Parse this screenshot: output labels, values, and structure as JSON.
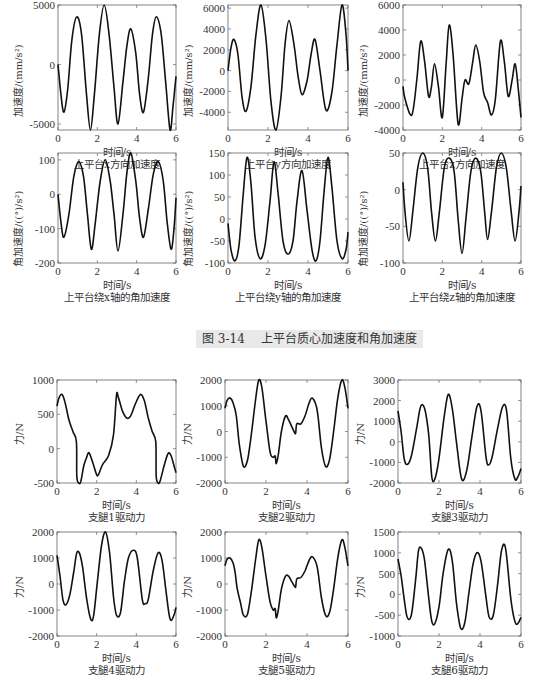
{
  "figure_caption": {
    "number": "图 3-14",
    "title": "上平台质心加速度和角加速度"
  },
  "chart_data": [
    {
      "id": "c1",
      "type": "line",
      "title": "上平台x方向加速度",
      "xlabel": "时间/s",
      "ylabel": "加速度/(mm/s²)",
      "box": [
        58,
        5,
        176,
        130
      ],
      "xlim": [
        0,
        6
      ],
      "ylim": [
        -5500,
        5000
      ],
      "xticks": [
        0,
        2,
        4,
        6
      ],
      "yticks": [
        -5000,
        0,
        5000
      ],
      "x": [
        0,
        0.15,
        0.3,
        0.5,
        0.7,
        0.95,
        1.2,
        1.45,
        1.65,
        1.85,
        2.1,
        2.35,
        2.6,
        2.85,
        3.05,
        3.3,
        3.5,
        3.7,
        3.95,
        4.15,
        4.35,
        4.6,
        4.8,
        5.0,
        5.25,
        5.5,
        5.7,
        5.85,
        6.0
      ],
      "y": [
        0,
        -2500,
        -4000,
        -2000,
        2000,
        4000,
        2500,
        -2500,
        -5500,
        -2500,
        2500,
        5000,
        2500,
        -2000,
        -5000,
        -1500,
        1500,
        3000,
        1000,
        -2500,
        -4000,
        -1000,
        2500,
        4000,
        2500,
        -2000,
        -5500,
        -3500,
        -1000
      ]
    },
    {
      "id": "c2",
      "type": "line",
      "title": "上平台y方向加速度",
      "xlabel": "时间/s",
      "ylabel": "加速度/(mm/s²)",
      "box": [
        228,
        5,
        348,
        130
      ],
      "xlim": [
        0,
        6
      ],
      "ylim": [
        -5700,
        6300
      ],
      "xticks": [
        0,
        2,
        4,
        6
      ],
      "yticks": [
        -4000,
        -2000,
        0,
        2000,
        4000,
        6000
      ],
      "x": [
        0,
        0.15,
        0.3,
        0.5,
        0.7,
        0.9,
        1.15,
        1.4,
        1.65,
        1.9,
        2.15,
        2.4,
        2.65,
        2.85,
        3.05,
        3.3,
        3.5,
        3.7,
        3.95,
        4.15,
        4.35,
        4.6,
        4.9,
        5.2,
        5.45,
        5.7,
        5.9,
        6.0
      ],
      "y": [
        0,
        2200,
        3000,
        1500,
        -2500,
        -3900,
        -1500,
        3500,
        6300,
        3000,
        -3000,
        -5700,
        -2500,
        2500,
        4800,
        2500,
        -500,
        -2300,
        -1000,
        1500,
        3000,
        0,
        -3800,
        -2000,
        2500,
        6300,
        3500,
        0
      ]
    },
    {
      "id": "c3",
      "type": "line",
      "title": "上平台z方向加速度",
      "xlabel": "时间/s",
      "ylabel": "加速度/(mm/s²)",
      "box": [
        403,
        5,
        521,
        130
      ],
      "xlim": [
        0,
        6
      ],
      "ylim": [
        -4000,
        6000
      ],
      "xticks": [
        0,
        2,
        4,
        6
      ],
      "yticks": [
        -4000,
        -2000,
        0,
        2000,
        4000,
        6000
      ],
      "x": [
        0,
        0.1,
        0.45,
        0.7,
        0.9,
        1.1,
        1.3,
        1.45,
        1.6,
        1.8,
        2.0,
        2.2,
        2.35,
        2.55,
        2.8,
        3.0,
        3.15,
        3.35,
        3.55,
        3.7,
        3.9,
        4.1,
        4.3,
        4.5,
        4.7,
        4.95,
        5.15,
        5.35,
        5.55,
        5.7,
        5.85,
        6.0
      ],
      "y": [
        -500,
        -1500,
        -2800,
        0,
        3100,
        1500,
        -1300,
        -500,
        1300,
        -500,
        -3000,
        1500,
        4400,
        2000,
        -3500,
        -1500,
        0,
        -300,
        1500,
        2800,
        1500,
        -1000,
        -1800,
        -2800,
        -1500,
        3100,
        1500,
        -1300,
        0,
        1300,
        -500,
        -3000
      ]
    },
    {
      "id": "c4",
      "type": "line",
      "title": "上平台绕x轴的角加速度",
      "xlabel": "时间/s",
      "ylabel": "角加速度/((°)/s²)",
      "box": [
        58,
        153,
        176,
        263
      ],
      "xlim": [
        0,
        6
      ],
      "ylim": [
        -200,
        120
      ],
      "xticks": [
        0,
        2,
        4,
        6
      ],
      "yticks": [
        -200,
        -100,
        0,
        100
      ],
      "x": [
        0,
        0.15,
        0.3,
        0.55,
        0.8,
        1.05,
        1.3,
        1.5,
        1.7,
        1.9,
        2.15,
        2.4,
        2.65,
        2.85,
        3.05,
        3.3,
        3.5,
        3.7,
        3.95,
        4.15,
        4.35,
        4.6,
        4.85,
        5.1,
        5.35,
        5.55,
        5.75,
        5.9,
        6.0
      ],
      "y": [
        0,
        -80,
        -125,
        -60,
        50,
        95,
        50,
        -60,
        -160,
        -80,
        40,
        100,
        40,
        -60,
        -165,
        -60,
        60,
        120,
        40,
        -70,
        -125,
        -40,
        60,
        95,
        40,
        -80,
        -160,
        -100,
        -10
      ]
    },
    {
      "id": "c5",
      "type": "line",
      "title": "上平台绕y轴的角加速度",
      "xlabel": "时间/s",
      "ylabel": "角加速度/((°)/s²)",
      "box": [
        228,
        153,
        348,
        263
      ],
      "xlim": [
        0,
        6
      ],
      "ylim": [
        -100,
        150
      ],
      "xticks": [
        0,
        2,
        4,
        6
      ],
      "yticks": [
        -100,
        -50,
        0,
        50,
        100,
        150
      ],
      "x": [
        0,
        0.15,
        0.35,
        0.55,
        0.75,
        0.95,
        1.15,
        1.35,
        1.6,
        1.85,
        2.1,
        2.3,
        2.5,
        2.75,
        3.0,
        3.25,
        3.45,
        3.7,
        3.95,
        4.2,
        4.4,
        4.6,
        4.8,
        5.0,
        5.2,
        5.45,
        5.7,
        5.9,
        6.0
      ],
      "y": [
        -10,
        -70,
        -95,
        -60,
        50,
        140,
        80,
        -40,
        -90,
        -60,
        40,
        130,
        60,
        -50,
        -80,
        -50,
        40,
        110,
        20,
        -70,
        -95,
        -50,
        60,
        140,
        70,
        -50,
        -90,
        -70,
        -30
      ]
    },
    {
      "id": "c6",
      "type": "line",
      "title": "上平台绕z轴的角加速度",
      "xlabel": "时间/s",
      "ylabel": "角加速度/((°)/s²)",
      "box": [
        403,
        153,
        521,
        263
      ],
      "xlim": [
        0,
        6
      ],
      "ylim": [
        -100,
        50
      ],
      "xticks": [
        0,
        2,
        4,
        6
      ],
      "yticks": [
        -100,
        -50,
        0,
        50
      ],
      "x": [
        0,
        0.1,
        0.3,
        0.5,
        0.75,
        1.0,
        1.25,
        1.45,
        1.65,
        1.85,
        2.1,
        2.35,
        2.6,
        2.8,
        3.0,
        3.2,
        3.45,
        3.7,
        3.95,
        4.15,
        4.3,
        4.5,
        4.75,
        5.0,
        5.25,
        5.5,
        5.7,
        5.9,
        6.0
      ],
      "y": [
        10,
        -30,
        -70,
        -30,
        30,
        50,
        30,
        -30,
        -70,
        -30,
        30,
        43,
        25,
        -40,
        -87,
        -40,
        25,
        43,
        25,
        -30,
        -68,
        -30,
        30,
        50,
        30,
        -30,
        -70,
        -30,
        5
      ]
    },
    {
      "id": "c7",
      "type": "line",
      "title": "支腿1驱动力",
      "xlabel": "时间/s",
      "ylabel": "力/N",
      "box": [
        57,
        380,
        176,
        483
      ],
      "xlim": [
        0,
        6
      ],
      "ylim": [
        -500,
        1000
      ],
      "xticks": [
        0,
        2,
        4,
        6
      ],
      "yticks": [
        -500,
        0,
        500,
        1000
      ],
      "x": [
        0,
        0.1,
        0.25,
        0.4,
        0.6,
        0.8,
        0.98,
        1.0,
        1.1,
        1.2,
        1.35,
        1.5,
        1.62,
        1.8,
        2.0,
        2.1,
        2.3,
        2.6,
        2.85,
        3.0,
        3.1,
        3.3,
        3.5,
        3.7,
        3.95,
        4.2,
        4.4,
        4.6,
        4.8,
        4.98,
        5.0,
        5.1,
        5.2,
        5.4,
        5.6,
        5.75,
        5.9,
        6.0
      ],
      "y": [
        620,
        740,
        790,
        680,
        420,
        250,
        100,
        -400,
        -500,
        -480,
        -250,
        -120,
        -60,
        -200,
        -380,
        -370,
        -230,
        -100,
        200,
        780,
        740,
        550,
        450,
        470,
        650,
        790,
        700,
        450,
        250,
        100,
        -400,
        -500,
        -470,
        -250,
        -70,
        -100,
        -250,
        -350
      ]
    },
    {
      "id": "c8",
      "type": "line",
      "title": "支腿2驱动力",
      "xlabel": "时间/s",
      "ylabel": "力/N",
      "box": [
        225,
        380,
        348,
        483
      ],
      "xlim": [
        0,
        6
      ],
      "ylim": [
        -2000,
        2000
      ],
      "xticks": [
        0,
        2,
        4,
        6
      ],
      "yticks": [
        -2000,
        -1000,
        0,
        1000,
        2000
      ],
      "x": [
        0,
        0.1,
        0.25,
        0.4,
        0.55,
        0.7,
        0.9,
        1.1,
        1.3,
        1.5,
        1.65,
        1.8,
        2.0,
        2.2,
        2.35,
        2.45,
        2.5,
        2.6,
        2.75,
        2.95,
        3.1,
        3.25,
        3.4,
        3.45,
        3.5,
        3.7,
        3.9,
        4.1,
        4.25,
        4.45,
        4.55,
        4.7,
        4.9,
        5.1,
        5.3,
        5.5,
        5.7,
        5.85,
        6.0
      ],
      "y": [
        900,
        1200,
        1300,
        1100,
        600,
        -500,
        -1350,
        -1100,
        0,
        1300,
        2000,
        1700,
        400,
        -800,
        -1000,
        -950,
        -1250,
        -900,
        0,
        600,
        450,
        200,
        -50,
        -50,
        300,
        300,
        600,
        1100,
        1300,
        1000,
        500,
        -600,
        -1350,
        -1100,
        0,
        1300,
        2000,
        1700,
        900
      ]
    },
    {
      "id": "c9",
      "type": "line",
      "title": "支腿3驱动力",
      "xlabel": "时间/s",
      "ylabel": "力/N",
      "box": [
        398,
        380,
        521,
        483
      ],
      "xlim": [
        0,
        6
      ],
      "ylim": [
        -2000,
        3000
      ],
      "xticks": [
        0,
        2,
        4,
        6
      ],
      "yticks": [
        -2000,
        -1000,
        0,
        1000,
        2000,
        3000
      ],
      "x": [
        0,
        0.15,
        0.3,
        0.45,
        0.65,
        0.9,
        1.1,
        1.3,
        1.5,
        1.65,
        1.8,
        2.0,
        2.25,
        2.45,
        2.65,
        2.85,
        3.1,
        3.35,
        3.6,
        3.85,
        4.05,
        4.3,
        4.45,
        4.6,
        4.85,
        5.1,
        5.3,
        5.5,
        5.7,
        5.85,
        6.0
      ],
      "y": [
        1500,
        500,
        -800,
        -1100,
        -700,
        600,
        1700,
        1600,
        300,
        -1700,
        -1800,
        -800,
        1200,
        2300,
        1600,
        0,
        -1800,
        -1400,
        200,
        1700,
        1500,
        -800,
        -1100,
        -700,
        600,
        1700,
        1500,
        -800,
        -1800,
        -1700,
        -1300
      ]
    },
    {
      "id": "c10",
      "type": "line",
      "title": "支腿4驱动力",
      "xlabel": "时间/s",
      "ylabel": "力/N",
      "box": [
        57,
        532,
        176,
        636
      ],
      "xlim": [
        0,
        6
      ],
      "ylim": [
        -2000,
        2000
      ],
      "xticks": [
        0,
        2,
        4,
        6
      ],
      "yticks": [
        -2000,
        -1000,
        0,
        1000,
        2000
      ],
      "x": [
        0,
        0.15,
        0.3,
        0.45,
        0.65,
        0.85,
        1.0,
        1.15,
        1.3,
        1.5,
        1.7,
        1.85,
        2.05,
        2.25,
        2.45,
        2.65,
        2.85,
        3.0,
        3.2,
        3.4,
        3.6,
        3.85,
        4.05,
        4.3,
        4.45,
        4.6,
        4.85,
        5.1,
        5.3,
        5.5,
        5.7,
        5.9,
        6.0
      ],
      "y": [
        1100,
        300,
        -600,
        -800,
        -400,
        500,
        1200,
        1150,
        600,
        -600,
        -1350,
        -1200,
        200,
        1500,
        2000,
        1200,
        -500,
        -1200,
        -1100,
        100,
        1000,
        1300,
        1000,
        -600,
        -750,
        -600,
        500,
        1200,
        900,
        -300,
        -1350,
        -1200,
        -900
      ]
    },
    {
      "id": "c11",
      "type": "line",
      "title": "支腿5驱动力",
      "xlabel": "时间/s",
      "ylabel": "力/N",
      "box": [
        225,
        532,
        348,
        636
      ],
      "xlim": [
        0,
        6
      ],
      "ylim": [
        -2000,
        2000
      ],
      "xticks": [
        0,
        2,
        4,
        6
      ],
      "yticks": [
        -2000,
        -1000,
        0,
        1000,
        2000
      ],
      "x": [
        0,
        0.1,
        0.25,
        0.4,
        0.5,
        0.6,
        0.75,
        0.9,
        1.1,
        1.3,
        1.5,
        1.65,
        1.8,
        2.0,
        2.2,
        2.35,
        2.45,
        2.5,
        2.6,
        2.75,
        2.95,
        3.1,
        3.25,
        3.4,
        3.45,
        3.5,
        3.7,
        3.9,
        4.1,
        4.25,
        4.45,
        4.55,
        4.7,
        4.9,
        5.1,
        5.3,
        5.5,
        5.7,
        5.85,
        6.0
      ],
      "y": [
        700,
        950,
        1000,
        800,
        400,
        -200,
        -700,
        -1200,
        -1150,
        -200,
        1000,
        1700,
        1400,
        300,
        -700,
        -1000,
        -950,
        -1300,
        -1000,
        -200,
        300,
        300,
        100,
        -100,
        -100,
        200,
        250,
        500,
        900,
        1050,
        800,
        400,
        -500,
        -1200,
        -1100,
        -200,
        1000,
        1700,
        1400,
        700
      ]
    },
    {
      "id": "c12",
      "type": "line",
      "title": "支腿6驱动力",
      "xlabel": "时间/s",
      "ylabel": "力/N",
      "box": [
        398,
        532,
        521,
        636
      ],
      "xlim": [
        0,
        6
      ],
      "ylim": [
        -1000,
        1500
      ],
      "xticks": [
        0,
        2,
        4,
        6
      ],
      "yticks": [
        -1000,
        -500,
        0,
        500,
        1000,
        1500
      ],
      "x": [
        0,
        0.15,
        0.3,
        0.45,
        0.65,
        0.85,
        1.0,
        1.15,
        1.3,
        1.5,
        1.65,
        1.8,
        2.0,
        2.2,
        2.45,
        2.65,
        2.85,
        3.05,
        3.25,
        3.45,
        3.65,
        3.85,
        4.05,
        4.3,
        4.45,
        4.65,
        4.85,
        5.05,
        5.25,
        5.5,
        5.7,
        5.85,
        6.0
      ],
      "y": [
        850,
        450,
        -100,
        -550,
        -500,
        300,
        1050,
        1100,
        800,
        -100,
        -650,
        -700,
        -300,
        500,
        1080,
        800,
        -200,
        -800,
        -700,
        0,
        700,
        1000,
        800,
        -100,
        -550,
        -500,
        200,
        1050,
        1100,
        -100,
        -650,
        -700,
        -550
      ]
    }
  ]
}
